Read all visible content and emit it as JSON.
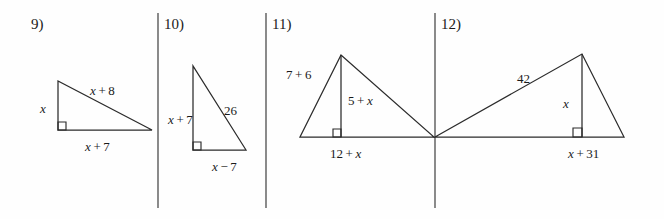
{
  "page": {
    "background_color": "#fefefe",
    "stroke_color": "#2b2b2b",
    "text_color": "#1a1a1a",
    "width": 664,
    "height": 219
  },
  "dividers": [
    {
      "name": "divider-1",
      "x": 158,
      "y1": 13,
      "y2": 208
    },
    {
      "name": "divider-2",
      "x": 266,
      "y1": 13,
      "y2": 208
    },
    {
      "name": "divider-3",
      "x": 435,
      "y1": 13,
      "y2": 208
    }
  ],
  "problems": [
    {
      "number": "9)",
      "number_pos": {
        "x": 31,
        "y": 17
      },
      "shape": "right-triangle",
      "vertices": [
        {
          "x": 58,
          "y": 81
        },
        {
          "x": 58,
          "y": 130
        },
        {
          "x": 152,
          "y": 130
        }
      ],
      "right_angle": {
        "x": 58,
        "y": 130,
        "dx": 1,
        "dy": -1,
        "size": 8
      },
      "labels": [
        {
          "name": "leg-vertical",
          "text": "x",
          "italic_parts": [
            0
          ],
          "x": 40,
          "y": 102,
          "align": "left"
        },
        {
          "name": "hypotenuse",
          "text": "x + 8",
          "italic_parts": [
            0
          ],
          "x": 90,
          "y": 84,
          "align": "left"
        },
        {
          "name": "leg-horizontal",
          "text": "x + 7",
          "italic_parts": [
            0
          ],
          "x": 85,
          "y": 140,
          "align": "left"
        }
      ]
    },
    {
      "number": "10)",
      "number_pos": {
        "x": 164,
        "y": 17
      },
      "shape": "right-triangle",
      "vertices": [
        {
          "x": 193,
          "y": 66
        },
        {
          "x": 193,
          "y": 150
        },
        {
          "x": 246,
          "y": 150
        }
      ],
      "right_angle": {
        "x": 193,
        "y": 150,
        "dx": 1,
        "dy": -1,
        "size": 8
      },
      "labels": [
        {
          "name": "leg-vertical",
          "text": "x + 7",
          "italic_parts": [
            0
          ],
          "x": 168,
          "y": 113,
          "align": "left"
        },
        {
          "name": "hypotenuse",
          "text": "26",
          "italic_parts": [],
          "x": 224,
          "y": 104,
          "align": "left"
        },
        {
          "name": "leg-horizontal",
          "text": "x − 7",
          "italic_parts": [
            0
          ],
          "x": 212,
          "y": 160,
          "align": "left"
        }
      ]
    },
    {
      "number": "11)",
      "number_pos": {
        "x": 272,
        "y": 17
      },
      "shape": "triangle-with-altitude",
      "vertices": [
        {
          "x": 300,
          "y": 137
        },
        {
          "x": 341,
          "y": 55
        },
        {
          "x": 434,
          "y": 137
        }
      ],
      "altitude": {
        "x1": 341,
        "y1": 55,
        "x2": 341,
        "y2": 137
      },
      "right_angle": {
        "x": 341,
        "y": 137,
        "dx": -1,
        "dy": -1,
        "size": 8
      },
      "labels": [
        {
          "name": "left-side",
          "text": "7 + 6",
          "italic_parts": [],
          "x": 286,
          "y": 68,
          "align": "left"
        },
        {
          "name": "altitude",
          "text": "5 + x",
          "italic_parts": [
            2
          ],
          "x": 348,
          "y": 94,
          "align": "left"
        },
        {
          "name": "base",
          "text": "12 + x",
          "italic_parts": [
            2
          ],
          "x": 330,
          "y": 147,
          "align": "left"
        }
      ]
    },
    {
      "number": "12)",
      "number_pos": {
        "x": 441,
        "y": 17
      },
      "shape": "triangle-with-altitude",
      "vertices": [
        {
          "x": 435,
          "y": 137
        },
        {
          "x": 582,
          "y": 54
        },
        {
          "x": 624,
          "y": 137
        }
      ],
      "altitude": {
        "x1": 582,
        "y1": 54,
        "x2": 582,
        "y2": 137
      },
      "right_angle": {
        "x": 582,
        "y": 137,
        "dx": -1,
        "dy": -1,
        "size": 9
      },
      "labels": [
        {
          "name": "hypotenuse",
          "text": "42",
          "italic_parts": [],
          "x": 517,
          "y": 72,
          "align": "left"
        },
        {
          "name": "altitude",
          "text": "x",
          "italic_parts": [
            0
          ],
          "x": 563,
          "y": 97,
          "align": "left"
        },
        {
          "name": "base-segment",
          "text": "x + 31",
          "italic_parts": [
            0
          ],
          "x": 568,
          "y": 147,
          "align": "left"
        }
      ]
    }
  ]
}
